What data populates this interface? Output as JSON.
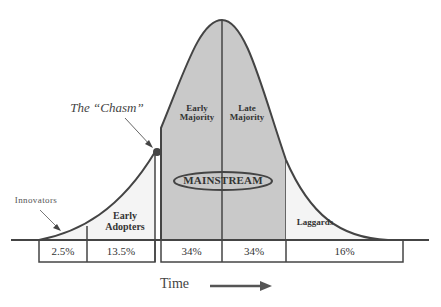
{
  "diagram": {
    "chasm_label": "The “Chasm”",
    "mainstream_label": "MAINSTREAM",
    "segments": [
      {
        "name": "Innovators",
        "percent": "2.5%"
      },
      {
        "name": "Early Adopters",
        "line1": "Early",
        "line2": "Adopters",
        "percent": "13.5%"
      },
      {
        "name": "Early Majority",
        "line1": "Early",
        "line2": "Majority",
        "percent": "34%"
      },
      {
        "name": "Late Majority",
        "line1": "Late",
        "line2": "Majority",
        "percent": "34%"
      },
      {
        "name": "Laggards",
        "percent": "16%"
      }
    ],
    "axis_label": "Time",
    "colors": {
      "mainstream_fill": "#c9c9c9",
      "tail_fill": "#f2f2f2",
      "stroke": "#444444",
      "text": "#333333"
    }
  }
}
